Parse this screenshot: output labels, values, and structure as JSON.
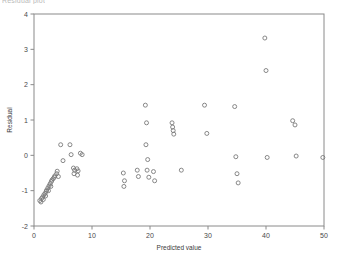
{
  "clipped_title": "Residual plot",
  "chart_data": {
    "type": "scatter",
    "title": "",
    "xlabel": "Predicted value",
    "ylabel": "Residual",
    "xlim": [
      0,
      50
    ],
    "ylim": [
      -2,
      4
    ],
    "xticks": [
      0,
      10,
      20,
      30,
      40,
      50
    ],
    "yticks": [
      -2,
      -1,
      0,
      1,
      2,
      3,
      4
    ],
    "xtick_labels": [
      "0",
      "10",
      "20",
      "30",
      "40",
      "50"
    ],
    "ytick_labels": [
      "-2",
      "-1",
      "0",
      "1",
      "2",
      "3",
      "4"
    ],
    "grid": false,
    "legend": null,
    "marker": "open-circle",
    "marker_color": "#7a7a7a",
    "points": [
      [
        1.0,
        -1.28
      ],
      [
        1.3,
        -1.22
      ],
      [
        1.5,
        -1.18
      ],
      [
        1.7,
        -1.12
      ],
      [
        1.9,
        -1.08
      ],
      [
        2.1,
        -1.02
      ],
      [
        2.2,
        -0.98
      ],
      [
        2.4,
        -0.92
      ],
      [
        2.6,
        -0.86
      ],
      [
        2.8,
        -0.8
      ],
      [
        3.0,
        -0.74
      ],
      [
        3.1,
        -0.7
      ],
      [
        3.3,
        -0.66
      ],
      [
        3.5,
        -0.62
      ],
      [
        2.9,
        -0.88
      ],
      [
        2.5,
        -1.0
      ],
      [
        2.0,
        -1.15
      ],
      [
        1.6,
        -1.25
      ],
      [
        1.2,
        -1.32
      ],
      [
        3.6,
        -0.58
      ],
      [
        3.9,
        -0.52
      ],
      [
        4.2,
        -0.6
      ],
      [
        4.0,
        -0.45
      ],
      [
        4.6,
        0.3
      ],
      [
        5.0,
        -0.15
      ],
      [
        6.8,
        -0.36
      ],
      [
        7.0,
        -0.42
      ],
      [
        7.4,
        -0.38
      ],
      [
        7.6,
        -0.44
      ],
      [
        6.9,
        -0.52
      ],
      [
        7.5,
        -0.56
      ],
      [
        8.0,
        0.06
      ],
      [
        8.3,
        0.02
      ],
      [
        6.2,
        0.3
      ],
      [
        6.4,
        0.02
      ],
      [
        15.4,
        -0.5
      ],
      [
        15.6,
        -0.72
      ],
      [
        15.5,
        -0.88
      ],
      [
        17.8,
        -0.42
      ],
      [
        18.0,
        -0.6
      ],
      [
        19.2,
        1.42
      ],
      [
        19.4,
        0.92
      ],
      [
        19.3,
        0.3
      ],
      [
        19.6,
        -0.12
      ],
      [
        19.5,
        -0.42
      ],
      [
        19.8,
        -0.62
      ],
      [
        20.6,
        -0.46
      ],
      [
        20.8,
        -0.72
      ],
      [
        23.8,
        0.92
      ],
      [
        23.9,
        0.8
      ],
      [
        24.0,
        0.7
      ],
      [
        24.1,
        0.6
      ],
      [
        25.4,
        -0.42
      ],
      [
        29.4,
        1.42
      ],
      [
        29.8,
        0.62
      ],
      [
        34.6,
        1.38
      ],
      [
        34.8,
        -0.04
      ],
      [
        35.0,
        -0.52
      ],
      [
        35.2,
        -0.78
      ],
      [
        39.8,
        3.32
      ],
      [
        40.0,
        2.4
      ],
      [
        40.2,
        -0.06
      ],
      [
        44.6,
        0.98
      ],
      [
        45.0,
        0.86
      ],
      [
        45.2,
        -0.02
      ],
      [
        49.8,
        -0.06
      ]
    ]
  }
}
